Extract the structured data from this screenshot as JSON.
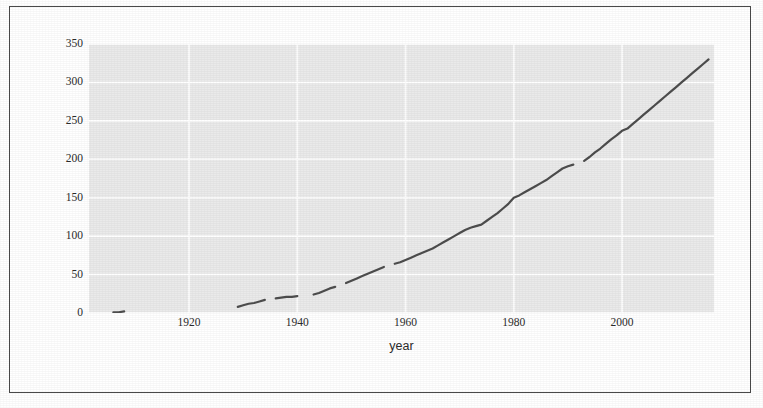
{
  "chart_data": {
    "type": "line",
    "title": "",
    "subtitle": "",
    "xlabel": "year",
    "ylabel": "",
    "xlim": [
      1901.5,
      2017.0
    ],
    "ylim": [
      0,
      350
    ],
    "grid": true,
    "legend": "none",
    "xticks": [
      1920,
      1940,
      1960,
      1980,
      2000
    ],
    "yticks": [
      0,
      50,
      100,
      150,
      200,
      250,
      300,
      350
    ],
    "panel_background": "#eaeaea",
    "gridline_color": "#ffffff",
    "line_color": "#4d4d4d",
    "series": [
      {
        "name": "count",
        "x": [
          1906,
          1907,
          1908,
          1929,
          1930,
          1931,
          1932,
          1933,
          1934,
          1936,
          1937,
          1938,
          1939,
          1940,
          1943,
          1944,
          1945,
          1946,
          1947,
          1949,
          1950,
          1951,
          1952,
          1953,
          1954,
          1955,
          1956,
          1958,
          1959,
          1960,
          1961,
          1962,
          1963,
          1964,
          1965,
          1966,
          1967,
          1968,
          1969,
          1970,
          1971,
          1972,
          1973,
          1974,
          1975,
          1976,
          1977,
          1978,
          1979,
          1980,
          1981,
          1982,
          1983,
          1984,
          1985,
          1986,
          1987,
          1988,
          1989,
          1990,
          1991,
          1993,
          1994,
          1995,
          1996,
          1997,
          1998,
          1999,
          2000,
          2001,
          2002,
          2003,
          2004,
          2005,
          2006,
          2007,
          2008,
          2009,
          2010,
          2011,
          2012,
          2013,
          2014,
          2015,
          2016
        ],
        "y": [
          1,
          1,
          2,
          8,
          10,
          12,
          13,
          15,
          17,
          19,
          20,
          21,
          21,
          22,
          24,
          26,
          29,
          32,
          34,
          39,
          42,
          45,
          48,
          51,
          54,
          57,
          60,
          64,
          66,
          69,
          72,
          75,
          78,
          81,
          84,
          88,
          92,
          96,
          100,
          104,
          108,
          111,
          113,
          115,
          120,
          125,
          130,
          136,
          142,
          150,
          153,
          157,
          161,
          165,
          169,
          173,
          178,
          183,
          188,
          191,
          193,
          198,
          203,
          209,
          214,
          220,
          226,
          231,
          237,
          240,
          246,
          252,
          258,
          264,
          270,
          276,
          282,
          288,
          294,
          300,
          306,
          312,
          318,
          324,
          330
        ],
        "gaps": [
          {
            "after": 1908,
            "before": 1929
          },
          {
            "after": 1934,
            "before": 1936
          },
          {
            "after": 1940,
            "before": 1943
          },
          {
            "after": 1947,
            "before": 1949
          },
          {
            "after": 1956,
            "before": 1958
          },
          {
            "after": 1991,
            "before": 1993
          }
        ]
      }
    ]
  },
  "axes": {
    "y_tick_labels": [
      "350",
      "300",
      "250",
      "200",
      "150",
      "100",
      "50",
      "0"
    ],
    "x_tick_labels": [
      "1920",
      "1940",
      "1960",
      "1980",
      "2000"
    ],
    "x_axis_title": "year"
  }
}
